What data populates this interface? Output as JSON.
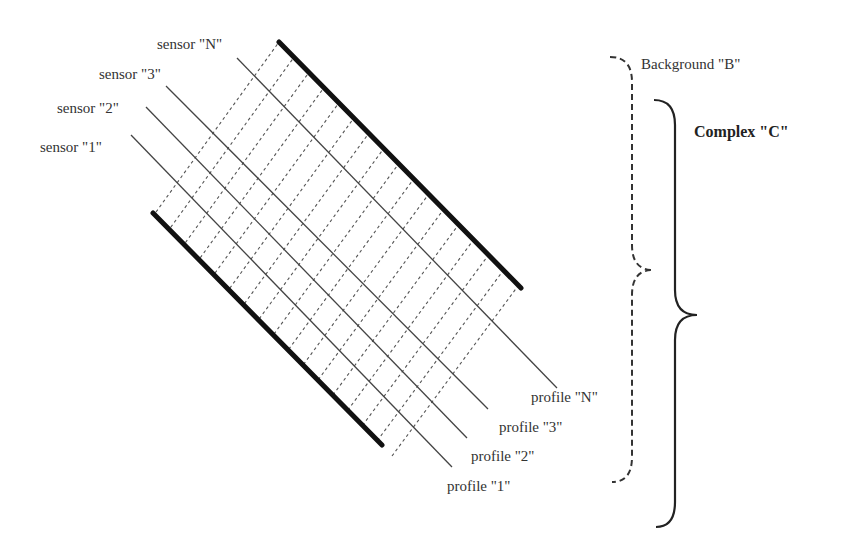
{
  "diagram": {
    "sensors": [
      {
        "label": "sensor \"1\"",
        "x": 40,
        "y": 140,
        "line": [
          131,
          135,
          452,
          467
        ]
      },
      {
        "label": "sensor \"2\"",
        "x": 57,
        "y": 101,
        "line": [
          146,
          107,
          467,
          438
        ]
      },
      {
        "label": "sensor \"3\"",
        "x": 98,
        "y": 68,
        "line": [
          166,
          86,
          488,
          409
        ]
      },
      {
        "label": "sensor \"N\"",
        "x": 157,
        "y": 37,
        "line": [
          237,
          58,
          557,
          388
        ]
      }
    ],
    "profiles": [
      {
        "label": "profile \"1\"",
        "x": 447,
        "y": 478
      },
      {
        "label": "profile \"2\"",
        "x": 471,
        "y": 449
      },
      {
        "label": "profile \"3\"",
        "x": 499,
        "y": 419
      },
      {
        "label": "profile \"N\"",
        "x": 531,
        "y": 388
      }
    ],
    "boundaries": {
      "top": [
        279,
        42,
        521,
        288
      ],
      "bottom": [
        153,
        213,
        382,
        445
      ]
    },
    "dashed_count": 17,
    "background_label": "Background \"B\"",
    "complex_label": "Complex \"C\"",
    "background_brace": {
      "x_top": 610,
      "y_top": 57,
      "x_mid": 632,
      "x_tip": 653,
      "y_tip": 270,
      "y_bottom": 482
    },
    "complex_brace": {
      "x_top": 654,
      "y_top": 100,
      "x_mid": 675,
      "x_tip": 697,
      "y_tip": 315,
      "y_bottom": 527
    },
    "colors": {
      "ink": "#222222",
      "thin": "#444444",
      "dash": "#555555"
    }
  }
}
